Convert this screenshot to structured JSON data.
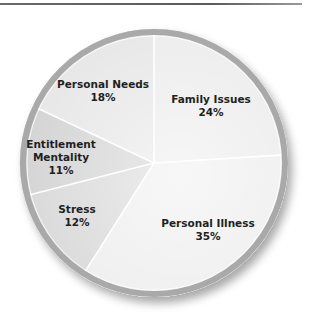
{
  "chart_data": {
    "type": "pie",
    "title": "",
    "start_angle_deg": 0,
    "direction": "clockwise",
    "slices": [
      {
        "label": "Family Issues",
        "value": 24,
        "value_label": "24%",
        "color": "#ececec",
        "label_lines": [
          "Family Issues"
        ],
        "label_pos": [
          211,
          103
        ]
      },
      {
        "label": "Personal Illness",
        "value": 35,
        "value_label": "35%",
        "color": "#eeeeee",
        "label_lines": [
          "Personal Illness"
        ],
        "label_pos": [
          208,
          227
        ]
      },
      {
        "label": "Stress",
        "value": 12,
        "value_label": "12%",
        "color": "#d9d9d9",
        "label_lines": [
          "Stress"
        ],
        "label_pos": [
          77,
          213
        ]
      },
      {
        "label": "Entitlement Mentality",
        "value": 11,
        "value_label": "11%",
        "color": "#d4d4d4",
        "label_lines": [
          "Entitlement",
          "Mentality"
        ],
        "label_pos": [
          61,
          148
        ]
      },
      {
        "label": "Personal Needs",
        "value": 18,
        "value_label": "18%",
        "color": "#e7e7e7",
        "label_lines": [
          "Personal Needs"
        ],
        "label_pos": [
          103,
          88
        ]
      }
    ],
    "legend": "none (labels inside slices)"
  },
  "geometry": {
    "cx": 154,
    "cy": 163,
    "r": 134,
    "rim_width": 6,
    "rim_color": "#a9a9a9",
    "divider_color": "#ffffff"
  }
}
